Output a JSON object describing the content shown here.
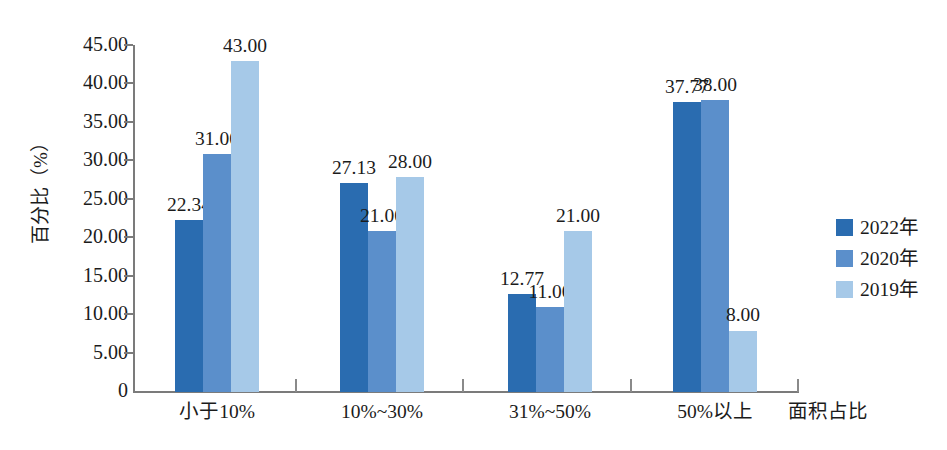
{
  "chart_data": {
    "type": "bar",
    "title": "",
    "subtitle": "",
    "xlabel": "面积占比",
    "ylabel": "百分比（%）",
    "categories": [
      "小于10%",
      "10%~30%",
      "31%~50%",
      "50%以上"
    ],
    "series": [
      {
        "name": "2022年",
        "color": "#2a6cb0",
        "values": [
          22.34,
          27.13,
          12.77,
          37.77
        ],
        "labels": [
          "22.34",
          "27.13",
          "12.77",
          "37.77"
        ]
      },
      {
        "name": "2020年",
        "color": "#5b8fcb",
        "values": [
          31.0,
          21.0,
          11.0,
          38.0
        ],
        "labels": [
          "31.00",
          "21.00",
          "11.00",
          "38.00"
        ]
      },
      {
        "name": "2019年",
        "color": "#a6c9e8",
        "values": [
          43.0,
          28.0,
          21.0,
          8.0
        ],
        "labels": [
          "43.00",
          "28.00",
          "21.00",
          "8.00"
        ]
      }
    ],
    "ylim": [
      0,
      45
    ],
    "ytick_labels": [
      "45.00",
      "40.00",
      "35.00",
      "30.00",
      "25.00",
      "20.00",
      "15.00",
      "10.00",
      "5.00",
      "0"
    ],
    "ytick_values": [
      45,
      40,
      35,
      30,
      25,
      20,
      15,
      10,
      5,
      0
    ],
    "grid": false,
    "legend_position": "right"
  },
  "legend": {
    "items": [
      {
        "label": "2022年",
        "color": "#2a6cb0"
      },
      {
        "label": "2020年",
        "color": "#5b8fcb"
      },
      {
        "label": "2019年",
        "color": "#a6c9e8"
      }
    ]
  }
}
